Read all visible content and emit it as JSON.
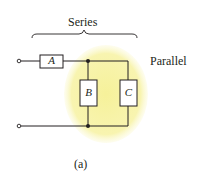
{
  "diagram": {
    "series_label": "Series",
    "parallel_label": "Parallel",
    "caption": "(a)",
    "components": [
      {
        "id": "A",
        "label": "A",
        "connection": "series"
      },
      {
        "id": "B",
        "label": "B",
        "connection": "parallel"
      },
      {
        "id": "C",
        "label": "C",
        "connection": "parallel"
      }
    ],
    "colors": {
      "highlight": "#f7f3a6",
      "line": "#231f20"
    }
  }
}
